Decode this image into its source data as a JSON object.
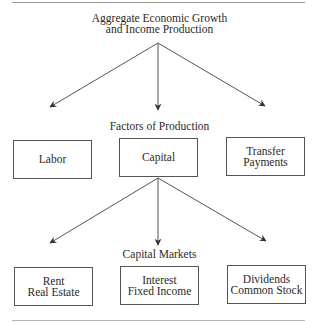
{
  "title": {
    "line1": "Aggregate Economic Growth",
    "line2": "and Income Production"
  },
  "levels": [
    {
      "label": "Factors of Production",
      "boxes": [
        {
          "lines": [
            "Labor"
          ]
        },
        {
          "lines": [
            "Capital"
          ]
        },
        {
          "lines": [
            "Transfer",
            "Payments"
          ]
        }
      ]
    },
    {
      "label": "Capital Markets",
      "boxes": [
        {
          "lines": [
            "Rent",
            "Real Estate"
          ]
        },
        {
          "lines": [
            "Interest",
            "Fixed Income"
          ]
        },
        {
          "lines": [
            "Dividends",
            "Common Stock"
          ]
        }
      ]
    }
  ],
  "edges": [
    {
      "from": "title",
      "to": "Labor"
    },
    {
      "from": "title",
      "to": "Capital"
    },
    {
      "from": "title",
      "to": "Transfer Payments"
    },
    {
      "from": "Capital",
      "to": "Rent / Real Estate"
    },
    {
      "from": "Capital",
      "to": "Interest / Fixed Income"
    },
    {
      "from": "Capital",
      "to": "Dividends / Common Stock"
    }
  ],
  "colors": {
    "line": "#555555",
    "text": "#2a2a2a",
    "background": "#ffffff"
  }
}
